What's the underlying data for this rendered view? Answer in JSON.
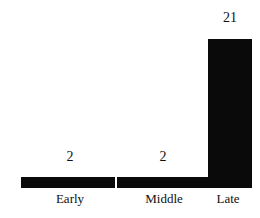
{
  "chart_data": {
    "type": "bar",
    "title": "",
    "subtitle": "",
    "xlabel": "",
    "ylabel": "",
    "categories": [
      "Early",
      "Middle",
      "Late"
    ],
    "values": [
      2,
      2,
      21
    ],
    "value_labels": [
      "2",
      "2",
      "21"
    ],
    "ylim": [
      0,
      21
    ],
    "grid": false,
    "legend": null,
    "legend_position": "none",
    "annotations": [],
    "series": [
      {
        "name": "",
        "values": [
          2,
          2,
          21
        ]
      }
    ],
    "colors": {
      "bar": "#0a0a0a",
      "background": "#ffffff",
      "text": "#111111"
    }
  },
  "bars": [
    {
      "category": "Early",
      "value": 2,
      "label": "2",
      "height_pct": "6.5%"
    },
    {
      "category": "Middle",
      "value": 2,
      "label": "2",
      "height_pct": "6.5%"
    },
    {
      "category": "Late",
      "value": 21,
      "label": "21",
      "height_pct": "85.5%"
    }
  ]
}
